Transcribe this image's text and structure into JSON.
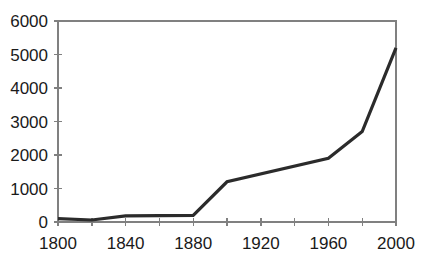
{
  "chart_data": {
    "type": "line",
    "title": "",
    "subtitle": "",
    "xlabel": "",
    "ylabel": "",
    "xlim": [
      1800,
      2000
    ],
    "ylim": [
      0,
      6000
    ],
    "grid": false,
    "legend": false,
    "legend_position": "none",
    "series": [
      {
        "name": "",
        "color": "#2b2b2b",
        "x": [
          1800,
          1820,
          1840,
          1880,
          1900,
          1960,
          1980,
          2000
        ],
        "values": [
          100,
          60,
          180,
          200,
          1200,
          1900,
          2700,
          5200
        ]
      }
    ],
    "x_ticks": [
      1800,
      1820,
      1840,
      1860,
      1880,
      1900,
      1920,
      1940,
      1960,
      1980,
      2000
    ],
    "x_tick_labels": [
      "1800",
      "",
      "1840",
      "",
      "1880",
      "",
      "1920",
      "",
      "1960",
      "",
      "2000"
    ],
    "y_ticks": [
      0,
      1000,
      2000,
      3000,
      4000,
      5000,
      6000
    ],
    "y_tick_labels": [
      "0",
      "1000",
      "2000",
      "3000",
      "4000",
      "5000",
      "6000"
    ],
    "axis_color": "#808080",
    "text_color": "#1a1a1a",
    "background": "#ffffff"
  },
  "geometry": {
    "plot_left": 58,
    "plot_right": 396,
    "plot_top": 21,
    "plot_bottom": 222
  }
}
